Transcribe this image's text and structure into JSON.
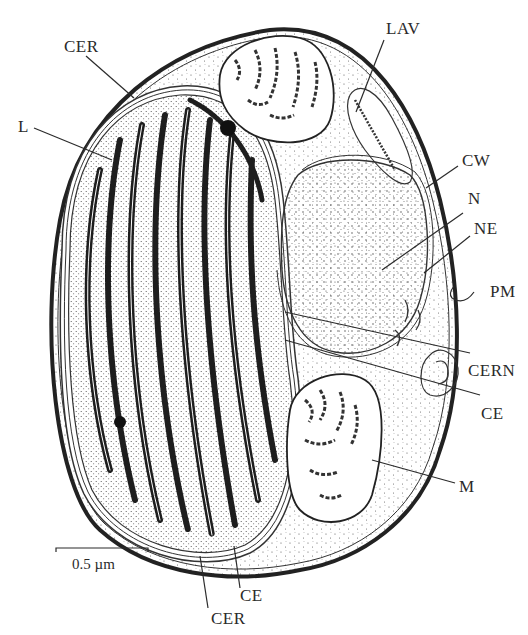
{
  "figure": {
    "scale_bar": {
      "label": "0.5 µm"
    },
    "labels": [
      {
        "id": "CER",
        "text": "CER",
        "position": "top-left"
      },
      {
        "id": "L",
        "text": "L",
        "position": "left"
      },
      {
        "id": "LAV",
        "text": "LAV",
        "position": "top-right"
      },
      {
        "id": "CW",
        "text": "CW",
        "position": "right"
      },
      {
        "id": "N",
        "text": "N",
        "position": "right"
      },
      {
        "id": "NE",
        "text": "NE",
        "position": "right"
      },
      {
        "id": "PM",
        "text": "PM",
        "position": "right"
      },
      {
        "id": "CERN",
        "text": "CERN",
        "position": "right"
      },
      {
        "id": "CE",
        "text": "CE",
        "position": "right"
      },
      {
        "id": "M",
        "text": "M",
        "position": "right"
      },
      {
        "id": "CE_bottom",
        "text": "CE",
        "position": "bottom"
      },
      {
        "id": "CER_bottom",
        "text": "CER",
        "position": "bottom"
      }
    ],
    "colors": {
      "ink": "#2a2a2a",
      "background": "#ffffff",
      "stipple": "#555555"
    }
  }
}
